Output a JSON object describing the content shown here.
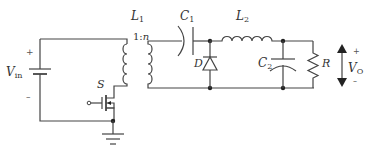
{
  "diagram": {
    "labels": {
      "vin_main": "V",
      "vin_sub": "in",
      "vin_plus": "+",
      "vin_minus": "–",
      "switch": "S",
      "l1_main": "L",
      "l1_sub": "1",
      "ratio": "1:",
      "ratio_n": "n",
      "c1_main": "C",
      "c1_sub": "1",
      "l2_main": "L",
      "l2_sub": "2",
      "diode": "D",
      "c2_main": "C",
      "c2_sub": "2",
      "resistor": "R",
      "vo_main": "V",
      "vo_sub": "O",
      "vo_plus": "+",
      "vo_minus": "–"
    },
    "components": [
      {
        "id": "Vin",
        "type": "dc-source"
      },
      {
        "id": "S",
        "type": "mosfet-switch"
      },
      {
        "id": "L1",
        "type": "transformer",
        "ratio": "1:n"
      },
      {
        "id": "C1",
        "type": "capacitor"
      },
      {
        "id": "D",
        "type": "diode"
      },
      {
        "id": "L2",
        "type": "inductor"
      },
      {
        "id": "C2",
        "type": "capacitor"
      },
      {
        "id": "R",
        "type": "resistor"
      },
      {
        "id": "VO",
        "type": "output-voltage-arrow"
      }
    ],
    "colors": {
      "line": "#444444",
      "text": "#333333",
      "background": "#ffffff"
    }
  }
}
